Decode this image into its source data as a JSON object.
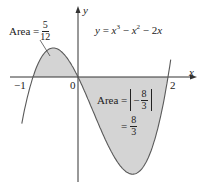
{
  "figure": {
    "title": "",
    "equation": {
      "lhs": "y",
      "rhs_parts": [
        "x",
        "3",
        " − ",
        "x",
        "2",
        " − 2",
        "x"
      ],
      "text": "y = x³ − x² − 2x"
    },
    "axes": {
      "x_label": "x",
      "y_label": "y",
      "ticks": {
        "neg_one": "−1",
        "zero": "0",
        "two": "2"
      }
    },
    "area_left": {
      "prefix": "Area =",
      "num": "5",
      "den": "12"
    },
    "area_right": {
      "prefix": "Area =",
      "inner_sign": "−",
      "num": "8",
      "den": "3",
      "eq": "=",
      "num2": "8",
      "den2": "3"
    },
    "colors": {
      "fill": "#d4d4d4",
      "curve": "#5a5a5a",
      "axis": "#333333"
    }
  },
  "chart_data": {
    "type": "line",
    "xlabel": "x",
    "ylabel": "y",
    "function": "x^3 - x^2 - 2x",
    "roots": [
      -1,
      0,
      2
    ],
    "x": [
      -1.25,
      -1,
      -0.75,
      -0.535,
      -0.25,
      0,
      0.25,
      0.5,
      0.75,
      1,
      1.215,
      1.5,
      1.75,
      2,
      2.05
    ],
    "values": [
      -0.89,
      0,
      0.61,
      0.63,
      0.42,
      0,
      -0.55,
      -1.13,
      -1.64,
      -2,
      -2.11,
      -1.88,
      -1.09,
      0,
      0.31
    ],
    "shaded_regions": [
      {
        "from": -1,
        "to": 0,
        "area": "5/12"
      },
      {
        "from": 0,
        "to": 2,
        "area": "|−8/3| = 8/3"
      }
    ],
    "annotations": [
      "Area = 5/12",
      "Area = |−8/3| = 8/3",
      "y = x^3 − x^2 − 2x"
    ],
    "grid": false
  }
}
